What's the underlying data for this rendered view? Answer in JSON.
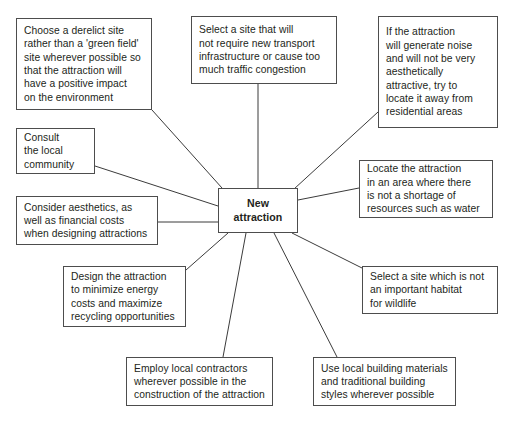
{
  "diagram": {
    "type": "spider-diagram",
    "title": "New attraction",
    "center": {
      "id": "center",
      "label": "New\nattraction",
      "x": 218,
      "y": 188,
      "width": 80,
      "height": 45
    },
    "colors": {
      "background": "#ffffff",
      "box_border": "#4d4d4d",
      "connector": "#3b3b3b",
      "text": "#231f20"
    },
    "nodes": [
      {
        "id": "derelict-site",
        "label": "Choose a derelict site\nrather than a 'green field'\nsite wherever possible so\nthat the attraction will\nhave a positive impact\non the environment",
        "x": 16,
        "y": 18,
        "width": 136,
        "height": 92
      },
      {
        "id": "transport-infrastructure",
        "label": "Select a site that will\nnot require new transport\ninfrastructure or cause too\nmuch traffic congestion",
        "x": 191,
        "y": 16,
        "width": 146,
        "height": 68
      },
      {
        "id": "noise-aesthetics",
        "label": "If the attraction\nwill generate noise\nand will not be very\naesthetically\nattractive, try to\nlocate it away from\nresidential areas",
        "x": 378,
        "y": 16,
        "width": 120,
        "height": 112
      },
      {
        "id": "consult-community",
        "label": "Consult\nthe local\ncommunity",
        "x": 16,
        "y": 128,
        "width": 79,
        "height": 46
      },
      {
        "id": "resource-shortage",
        "label": "Locate the attraction\nin an area where there\nis not a shortage of\nresources such as water",
        "x": 359,
        "y": 160,
        "width": 134,
        "height": 58
      },
      {
        "id": "aesthetics-costs",
        "label": "Consider aesthetics, as\nwell as financial costs\nwhen designing attractions",
        "x": 16,
        "y": 196,
        "width": 142,
        "height": 49
      },
      {
        "id": "energy-recycling",
        "label": "Design the attraction\nto minimize energy\ncosts and maximize\nrecycling opportunities",
        "x": 63,
        "y": 266,
        "width": 123,
        "height": 61
      },
      {
        "id": "wildlife-habitat",
        "label": "Select a site which is not\nan important habitat\nfor wildlife",
        "x": 362,
        "y": 266,
        "width": 136,
        "height": 48
      },
      {
        "id": "local-contractors",
        "label": "Employ local contractors\nwherever possible in the\nconstruction of the attraction",
        "x": 126,
        "y": 357,
        "width": 147,
        "height": 49
      },
      {
        "id": "local-materials",
        "label": "Use local building materials\nand traditional building\nstyles wherever possible",
        "x": 313,
        "y": 357,
        "width": 143,
        "height": 49
      }
    ],
    "connectors": [
      {
        "id": "c-derelict-site",
        "from": "derelict-site",
        "x1": 152,
        "y1": 110,
        "x2": 222,
        "y2": 188
      },
      {
        "id": "c-transport-infrastructure",
        "from": "transport-infrastructure",
        "x1": 258,
        "y1": 84,
        "x2": 258,
        "y2": 188
      },
      {
        "id": "c-noise-aesthetics",
        "from": "noise-aesthetics",
        "x1": 378,
        "y1": 112,
        "x2": 294,
        "y2": 189
      },
      {
        "id": "c-consult-community",
        "from": "consult-community",
        "x1": 95,
        "y1": 166,
        "x2": 218,
        "y2": 206
      },
      {
        "id": "c-resource-shortage",
        "from": "resource-shortage",
        "x1": 359,
        "y1": 188,
        "x2": 298,
        "y2": 200
      },
      {
        "id": "c-aesthetics-costs",
        "from": "aesthetics-costs",
        "x1": 158,
        "y1": 222,
        "x2": 218,
        "y2": 222
      },
      {
        "id": "c-energy-recycling",
        "from": "energy-recycling",
        "x1": 186,
        "y1": 270,
        "x2": 228,
        "y2": 233
      },
      {
        "id": "c-wildlife-habitat",
        "from": "wildlife-habitat",
        "x1": 362,
        "y1": 268,
        "x2": 292,
        "y2": 233
      },
      {
        "id": "c-local-contractors",
        "from": "local-contractors",
        "x1": 223,
        "y1": 357,
        "x2": 246,
        "y2": 233
      },
      {
        "id": "c-local-materials",
        "from": "local-materials",
        "x1": 337,
        "y1": 357,
        "x2": 274,
        "y2": 233
      }
    ]
  }
}
